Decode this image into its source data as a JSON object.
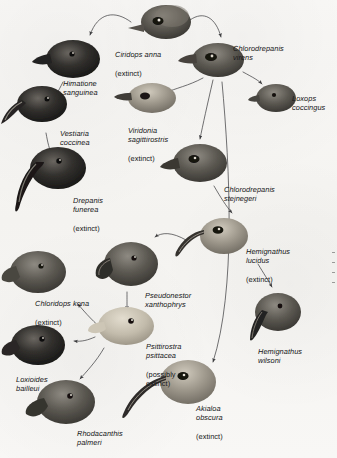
{
  "figure": {
    "type": "phylogenetic-diagram",
    "background_color": "#f7f6f4",
    "text_color": "#17181a",
    "arrow_color": "#3b3b3d"
  },
  "taxa": [
    {
      "id": "ciridops-anna",
      "genus_species": "Ciridops anna",
      "status": "(extinct)",
      "label_x": 115,
      "label_y": 41,
      "bird_x": 128,
      "bird_y": 3,
      "bird_w": 64,
      "bird_h": 38,
      "bill": "short-conical",
      "tone": "#585550"
    },
    {
      "id": "chlorodrepanis-virens",
      "genus_species": "Chlorodrepanis virens",
      "status": "",
      "label_x": 233,
      "label_y": 35,
      "bird_x": 186,
      "bird_y": 38,
      "bird_w": 62,
      "bird_h": 42,
      "bill": "short-decurved",
      "tone": "#56524b"
    },
    {
      "id": "himatione-sanguinea",
      "genus_species": "Himatione sanguinea",
      "status": "",
      "label_x": 63,
      "label_y": 70,
      "bird_x": 40,
      "bird_y": 38,
      "bird_w": 62,
      "bird_h": 44,
      "bill": "short-decurved",
      "tone": "#2d2b29"
    },
    {
      "id": "loxops-coccingus",
      "genus_species": "Loxops coccingus",
      "status": "",
      "label_x": 292,
      "label_y": 85,
      "bird_x": 252,
      "bird_y": 83,
      "bird_w": 46,
      "bird_h": 32,
      "bill": "short-crossed",
      "tone": "#4e4b46"
    },
    {
      "id": "vestiaria-coccinea",
      "genus_species": "Vestiaria coccinea",
      "status": "",
      "label_x": 60,
      "label_y": 120,
      "bird_x": 4,
      "bird_y": 85,
      "bird_w": 66,
      "bird_h": 48,
      "bill": "long-decurved",
      "tone": "#232221"
    },
    {
      "id": "viridonia-sagittirostris",
      "genus_species": "Viridonia sagittirostris",
      "status": "(extinct)",
      "label_x": 128,
      "label_y": 117,
      "bird_x": 118,
      "bird_y": 82,
      "bird_w": 60,
      "bird_h": 36,
      "bill": "straight-stout",
      "tone": "#6b6862"
    },
    {
      "id": "drepanis-funerea",
      "genus_species": "Drepanis funerea",
      "status": "(extinct)",
      "label_x": 73,
      "label_y": 187,
      "bird_x": 20,
      "bird_y": 140,
      "bird_w": 72,
      "bird_h": 72,
      "bill": "very-long-decurved",
      "tone": "#1d1c1b"
    },
    {
      "id": "chlorodrepanis-stejnegeri",
      "genus_species": "Chlorodrepanis stejnegeri",
      "status": "",
      "label_x": 224,
      "label_y": 176,
      "bird_x": 168,
      "bird_y": 142,
      "bird_w": 62,
      "bird_h": 44,
      "bill": "short-decurved",
      "tone": "#48453f"
    },
    {
      "id": "hemignathus-lucidus",
      "genus_species": "Hemignathus lucidus",
      "status": "(extinct)",
      "label_x": 246,
      "label_y": 238,
      "bird_x": 182,
      "bird_y": 214,
      "bird_w": 68,
      "bird_h": 48,
      "bill": "long-sickle",
      "tone": "#6e6b64"
    },
    {
      "id": "chloridops-kona",
      "genus_species": "Chloridops kona",
      "status": "(extinct)",
      "label_x": 35,
      "label_y": 290,
      "bird_x": 4,
      "bird_y": 248,
      "bird_w": 66,
      "bird_h": 48,
      "bill": "massive-finch",
      "tone": "#55524c"
    },
    {
      "id": "pseudonestor-xanthophrys",
      "genus_species": "Pseudonestor xanthophrys",
      "status": "",
      "label_x": 145,
      "label_y": 282,
      "bird_x": 95,
      "bird_y": 240,
      "bird_w": 66,
      "bird_h": 52,
      "bill": "parrot-hooked",
      "tone": "#4b4842"
    },
    {
      "id": "hemignathus-wilsoni",
      "genus_species": "Hemignathus wilsoni",
      "status": "",
      "label_x": 258,
      "label_y": 338,
      "bird_x": 248,
      "bird_y": 288,
      "bird_w": 58,
      "bird_h": 56,
      "bill": "short-lower-long-upper",
      "tone": "#3a3834"
    },
    {
      "id": "psittirostra-psittacea",
      "genus_species": "Psittirostra psittacea",
      "status": "(possibly extinct)",
      "label_x": 146,
      "label_y": 333,
      "bird_x": 90,
      "bird_y": 303,
      "bird_w": 66,
      "bird_h": 46,
      "bill": "parrot-stout",
      "tone": "#b6ae9e"
    },
    {
      "id": "loxioides-bailleui",
      "genus_species": "Loxioides bailleui",
      "status": "",
      "label_x": 16,
      "label_y": 366,
      "bird_x": 4,
      "bird_y": 324,
      "bird_w": 64,
      "bird_h": 44,
      "bill": "stout-finch",
      "tone": "#3c3a36"
    },
    {
      "id": "akialoa-obscura",
      "genus_species": "Akialoa obscura",
      "status": "(extinct)",
      "label_x": 196,
      "label_y": 395,
      "bird_x": 128,
      "bird_y": 355,
      "bird_w": 84,
      "bird_h": 64,
      "bill": "extremely-long-decurved",
      "tone": "#6a675f"
    },
    {
      "id": "rhodacanthis-palmeri",
      "genus_species": "Rhodacanthis palmeri",
      "status": "(extinct)",
      "label_x": 77,
      "label_y": 420,
      "bird_x": 28,
      "bird_y": 378,
      "bird_w": 68,
      "bird_h": 48,
      "bill": "massive-grosbeak",
      "tone": "#3f3d39"
    }
  ],
  "edges": [
    {
      "from": "ciridops-anna",
      "to": "himatione-sanguinea"
    },
    {
      "from": "ciridops-anna",
      "to": "chlorodrepanis-virens"
    },
    {
      "from": "himatione-sanguinea",
      "to": "vestiaria-coccinea"
    },
    {
      "from": "vestiaria-coccinea",
      "to": "drepanis-funerea"
    },
    {
      "from": "chlorodrepanis-virens",
      "to": "loxops-coccingus"
    },
    {
      "from": "chlorodrepanis-virens",
      "to": "viridonia-sagittirostris"
    },
    {
      "from": "chlorodrepanis-virens",
      "to": "chlorodrepanis-stejnegeri"
    },
    {
      "from": "chlorodrepanis-virens",
      "to": "akialoa-obscura"
    },
    {
      "from": "chlorodrepanis-stejnegeri",
      "to": "hemignathus-lucidus"
    },
    {
      "from": "hemignathus-lucidus",
      "to": "hemignathus-wilsoni"
    },
    {
      "from": "hemignathus-lucidus",
      "to": "pseudonestor-xanthophrys"
    },
    {
      "from": "pseudonestor-xanthophrys",
      "to": "psittirostra-psittacea"
    },
    {
      "from": "psittirostra-psittacea",
      "to": "chloridops-kona"
    },
    {
      "from": "psittirostra-psittacea",
      "to": "loxioides-bailleui"
    },
    {
      "from": "psittirostra-psittacea",
      "to": "rhodacanthis-palmeri"
    }
  ]
}
